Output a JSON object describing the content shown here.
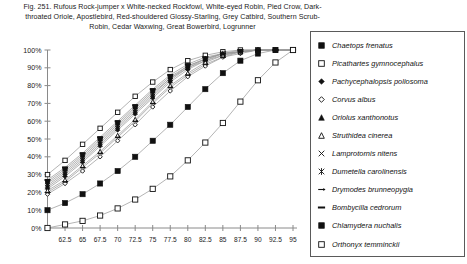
{
  "caption": {
    "lines": [
      "Fig. 251.  Rufous Rock-jumper x White-necked Rockfowl, White-eyed Robin, Pied Crow, Dark-",
      "throated Oriole, Apostlebird, Red-shouldered Glossy-Starling, Grey Catbird, Southern Scrub-",
      "Robin, Cedar Waxwing, Great Bowerbird, Logrunner"
    ]
  },
  "legend": {
    "items": [
      {
        "label": "Chaetops frenatus",
        "marker": "filled-square"
      },
      {
        "label": "Picathartes gymnocephalus",
        "marker": "open-square"
      },
      {
        "label": "Pachycephalopsis poliosoma",
        "marker": "filled-diamond"
      },
      {
        "label": "Corvus albus",
        "marker": "open-diamond"
      },
      {
        "label": "Oriolus xanthonotus",
        "marker": "filled-triangle"
      },
      {
        "label": "Struthidea cinerea",
        "marker": "open-triangle"
      },
      {
        "label": "Lamprotornis nitens",
        "marker": "cross-x"
      },
      {
        "label": "Dumetella carolinensis",
        "marker": "asterisk"
      },
      {
        "label": "Drymodes brunneopygia",
        "marker": "dash-arrow"
      },
      {
        "label": "Bombycilla cedrorum",
        "marker": "thick-dash"
      },
      {
        "label": "Chlamydera nuchalis",
        "marker": "filled-square"
      },
      {
        "label": "Orthonyx temminckii",
        "marker": "open-square"
      }
    ]
  },
  "chart_data": {
    "type": "line",
    "xlabel": "",
    "ylabel": "",
    "grid": false,
    "legend_position": "right",
    "xlim": [
      60,
      95
    ],
    "ylim": [
      0,
      100
    ],
    "yticks": [
      0,
      10,
      20,
      30,
      40,
      50,
      60,
      70,
      80,
      90,
      100
    ],
    "ytick_labels": [
      "0%",
      "10%",
      "20%",
      "30%",
      "40%",
      "50%",
      "60%",
      "70%",
      "80%",
      "90%",
      "100%"
    ],
    "xticks": [
      62.5,
      65,
      67.5,
      70,
      72.5,
      75,
      77.5,
      80,
      82.5,
      85,
      87.5,
      90,
      92.5,
      95
    ],
    "xtick_labels": [
      "62.5",
      "65",
      "67.5",
      "70",
      "72.5",
      "75",
      "77.5",
      "80",
      "82.5",
      "85",
      "87.5",
      "90",
      "92.5",
      "95"
    ],
    "x": [
      60,
      62.5,
      65,
      67.5,
      70,
      72.5,
      75,
      77.5,
      80,
      82.5,
      85,
      87.5,
      90,
      92.5,
      95
    ],
    "series": [
      {
        "name": "Chaetops frenatus",
        "marker": "filled-square",
        "values": [
          26,
          33,
          41,
          50,
          59,
          68,
          77,
          85,
          91,
          95,
          98,
          99,
          100,
          100,
          100
        ]
      },
      {
        "name": "Picathartes gymnocephalus",
        "marker": "open-square",
        "values": [
          30,
          38,
          47,
          56,
          65,
          74,
          82,
          89,
          94,
          97,
          99,
          100,
          100,
          100,
          100
        ]
      },
      {
        "name": "Pachycephalopsis poliosoma",
        "marker": "filled-diamond",
        "values": [
          22,
          29,
          37,
          46,
          55,
          64,
          73,
          82,
          89,
          94,
          97,
          99,
          100,
          100,
          100
        ]
      },
      {
        "name": "Corvus albus",
        "marker": "open-diamond",
        "values": [
          19,
          25,
          32,
          40,
          49,
          58,
          68,
          77,
          85,
          91,
          96,
          98,
          100,
          100,
          100
        ]
      },
      {
        "name": "Oriolus xanthonotus",
        "marker": "filled-triangle",
        "values": [
          24,
          31,
          39,
          48,
          57,
          66,
          75,
          84,
          90,
          95,
          98,
          99,
          100,
          100,
          100
        ]
      },
      {
        "name": "Struthidea cinerea",
        "marker": "open-triangle",
        "values": [
          21,
          27,
          35,
          43,
          52,
          61,
          71,
          80,
          87,
          93,
          97,
          99,
          100,
          100,
          100
        ]
      },
      {
        "name": "Lamprotornis nitens",
        "marker": "cross-x",
        "values": [
          23,
          30,
          38,
          47,
          56,
          65,
          74,
          83,
          90,
          94,
          98,
          99,
          100,
          100,
          100
        ]
      },
      {
        "name": "Dumetella carolinensis",
        "marker": "asterisk",
        "values": [
          25,
          32,
          40,
          49,
          58,
          67,
          76,
          84,
          91,
          95,
          98,
          99,
          100,
          100,
          100
        ]
      },
      {
        "name": "Drymodes brunneopygia",
        "marker": "dash-arrow",
        "values": [
          20,
          26,
          34,
          42,
          51,
          60,
          70,
          79,
          86,
          92,
          96,
          99,
          100,
          100,
          100
        ]
      },
      {
        "name": "Bombycilla cedrorum",
        "marker": "thick-dash",
        "values": [
          27,
          34,
          42,
          51,
          60,
          69,
          78,
          86,
          92,
          96,
          98,
          100,
          100,
          100,
          100
        ]
      },
      {
        "name": "Chlamydera nuchalis",
        "marker": "filled-square",
        "values": [
          10,
          14,
          19,
          25,
          32,
          40,
          49,
          58,
          68,
          78,
          87,
          94,
          98,
          100,
          100
        ]
      },
      {
        "name": "Orthonyx temminckii",
        "marker": "open-square",
        "values": [
          0,
          2,
          4,
          7,
          11,
          16,
          22,
          29,
          38,
          48,
          59,
          71,
          83,
          93,
          100
        ]
      }
    ]
  }
}
